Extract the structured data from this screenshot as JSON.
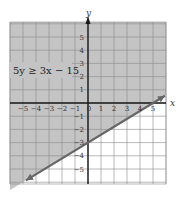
{
  "chart_data": {
    "type": "line",
    "title": "",
    "xlabel": "x",
    "ylabel": "y",
    "xlim": [
      -6,
      6
    ],
    "ylim": [
      -6.2,
      6.2
    ],
    "grid": true,
    "x_ticks": [
      -5,
      -4,
      -3,
      -2,
      -1,
      0,
      1,
      2,
      3,
      4,
      5
    ],
    "x_tick_labels": [
      "−5",
      "−4",
      "−3",
      "−2",
      "−1",
      "0",
      "1",
      "2",
      "3",
      "4",
      "5"
    ],
    "y_ticks": [
      5,
      4,
      3,
      2,
      1,
      -1,
      -2,
      -3,
      -4,
      -5
    ],
    "y_tick_labels": [
      "5",
      "4",
      "3",
      "2",
      "1",
      "1",
      "2",
      "3",
      "4",
      "5"
    ],
    "series": [
      {
        "name": "boundary line 5y = 3x − 15",
        "equation": "y = 0.6x − 3",
        "points": [
          [
            -4.77,
            -5.86
          ],
          [
            0,
            -3
          ],
          [
            5,
            0
          ],
          [
            5.92,
            0.55
          ]
        ],
        "style": "solid",
        "arrows": "both"
      }
    ],
    "shaded_region": "above line (y ≥ 0.6x − 3)",
    "annotations": [
      {
        "text": "5y ≥ 3x − 15",
        "x": -5.8,
        "y": 2.4
      }
    ],
    "colors": {
      "shade": "#c4c4c4",
      "grid": "#8a8a8a",
      "axis": "#1a1a1a",
      "line": "#666666",
      "unshaded": "#ffffff"
    }
  },
  "labels": {
    "x_axis": "x",
    "y_axis": "y",
    "inequality": "5y ≥ 3x − 15"
  }
}
